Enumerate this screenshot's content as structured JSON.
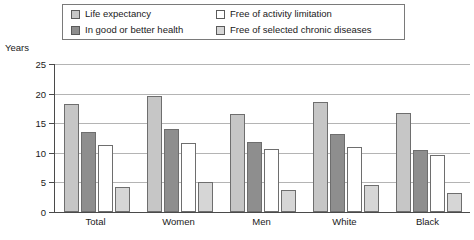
{
  "chart_data": {
    "type": "bar",
    "title": "",
    "xlabel": "",
    "ylabel": "Years",
    "ylim": [
      0,
      25
    ],
    "ytick_values": [
      25,
      20,
      15,
      10,
      5,
      0
    ],
    "grid": true,
    "legend_position": "top",
    "categories": [
      "Total",
      "Women",
      "Men",
      "White",
      "Black"
    ],
    "series": [
      {
        "name": "Life expectancy",
        "color": "#c6c6c6",
        "values": [
          18.2,
          19.6,
          16.6,
          18.5,
          16.8
        ]
      },
      {
        "name": "In good or better health",
        "color": "#8e8e8e",
        "values": [
          13.6,
          14.1,
          11.8,
          13.2,
          10.4
        ]
      },
      {
        "name": "Free of activity limitation",
        "color": "#ffffff",
        "values": [
          11.3,
          11.6,
          10.7,
          11.0,
          9.7
        ]
      },
      {
        "name": "Free of selected chronic diseases",
        "color": "#d6d6d6",
        "values": [
          4.2,
          5.1,
          3.8,
          4.5,
          3.2
        ]
      }
    ]
  },
  "legend": {
    "items": [
      {
        "label": "Life expectancy",
        "swatch": "#c6c6c6"
      },
      {
        "label": "Free of activity limitation",
        "swatch": "#ffffff"
      },
      {
        "label": "In good or better health",
        "swatch": "#8e8e8e"
      },
      {
        "label": "Free of selected chronic diseases",
        "swatch": "#d6d6d6"
      }
    ]
  },
  "axis": {
    "y_title": "Years"
  }
}
